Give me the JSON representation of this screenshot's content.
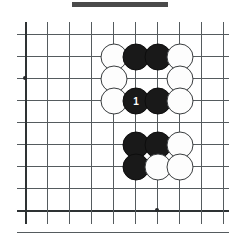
{
  "figure": {
    "header_bar": {
      "visible": true,
      "x": 72,
      "y": 2,
      "width": 96,
      "height": 5,
      "color": "#4a4a4a"
    }
  },
  "board": {
    "columns": 10,
    "rows": 10,
    "spacing": 22,
    "origin_x": 25,
    "origin_y": 34,
    "line_color": "#555b5e",
    "edge_color": "#2e3234",
    "background": "#ffffff",
    "x_positions": [
      25,
      47,
      69,
      91,
      113,
      135,
      157,
      179,
      201,
      223
    ],
    "y_positions": [
      34,
      56,
      78,
      100,
      122,
      144,
      166,
      188,
      210,
      232
    ],
    "edges": {
      "left_col": 0,
      "bottom_row": 8
    },
    "star_points": [
      {
        "name": "hoshi-left",
        "col": 0,
        "row": 2
      },
      {
        "name": "hoshi-bottom",
        "col": 6,
        "row": 8
      }
    ]
  },
  "stones": [
    {
      "id": "w-c4-r1",
      "color": "white",
      "col": 4,
      "row": 1,
      "label": ""
    },
    {
      "id": "b-c5-r1",
      "color": "black",
      "col": 5,
      "row": 1,
      "label": ""
    },
    {
      "id": "b-c6-r1",
      "color": "black",
      "col": 6,
      "row": 1,
      "label": ""
    },
    {
      "id": "w-c7-r1",
      "color": "white",
      "col": 7,
      "row": 1,
      "label": ""
    },
    {
      "id": "w-c4-r2",
      "color": "white",
      "col": 4,
      "row": 2,
      "label": ""
    },
    {
      "id": "w-c7-r2",
      "color": "white",
      "col": 7,
      "row": 2,
      "label": ""
    },
    {
      "id": "w-c4-r3",
      "color": "white",
      "col": 4,
      "row": 3,
      "label": ""
    },
    {
      "id": "b-c5-r3",
      "color": "black",
      "col": 5,
      "row": 3,
      "label": "1"
    },
    {
      "id": "b-c6-r3",
      "color": "black",
      "col": 6,
      "row": 3,
      "label": ""
    },
    {
      "id": "w-c7-r3",
      "color": "white",
      "col": 7,
      "row": 3,
      "label": ""
    },
    {
      "id": "b-c5-r5",
      "color": "black",
      "col": 5,
      "row": 5,
      "label": ""
    },
    {
      "id": "b-c6-r5",
      "color": "black",
      "col": 6,
      "row": 5,
      "label": ""
    },
    {
      "id": "w-c7-r5",
      "color": "white",
      "col": 7,
      "row": 5,
      "label": ""
    },
    {
      "id": "b-c5-r6",
      "color": "black",
      "col": 5,
      "row": 6,
      "label": ""
    },
    {
      "id": "w-c6-r6",
      "color": "white",
      "col": 6,
      "row": 6,
      "label": ""
    },
    {
      "id": "w-c7-r6",
      "color": "white",
      "col": 7,
      "row": 6,
      "label": ""
    }
  ],
  "move_markers": [
    {
      "number": "1",
      "col": 5,
      "row": 3,
      "color": "black"
    }
  ]
}
